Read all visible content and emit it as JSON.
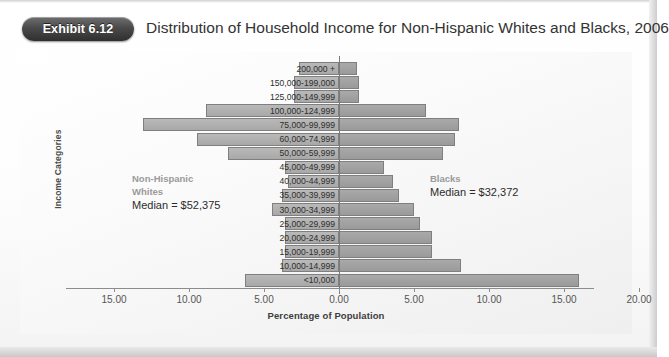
{
  "exhibit": {
    "badge_label": "Exhibit 6.12"
  },
  "header": {
    "title": "Distribution of Household Income for Non-Hispanic Whites and Blacks, 2006"
  },
  "annotations": {
    "left": {
      "group_line1": "Non-Hispanic",
      "group_line2": "Whites",
      "median": "Median = $52,375"
    },
    "right": {
      "group_line1": "Blacks",
      "median": "Median = $32,372"
    }
  },
  "chart_data": {
    "type": "bar",
    "subtype": "population-pyramid",
    "title": "Distribution of Household Income for Non-Hispanic Whites and Blacks, 2006",
    "xlabel": "Percentage of Population",
    "ylabel": "Income Categories",
    "grid": false,
    "legend_position": "in-plot-annotations",
    "x_tick_labels": [
      "15.00",
      "10.00",
      "5.00",
      "0.00",
      "5.00",
      "10.00",
      "15.00",
      "20.00"
    ],
    "x_tick_values": [
      -15,
      -10,
      -5,
      0,
      5,
      10,
      15,
      20
    ],
    "xlim": [
      -17.5,
      21.5
    ],
    "categories": [
      "200,000 +",
      "150,000-199,000",
      "125,000-149,999",
      "100,000-124,999",
      "75,000-99,999",
      "60,000-74,999",
      "50,000-59,999",
      "45,000-49,999",
      "40,000-44,999",
      "35,000-39,999",
      "30,000-34,999",
      "25,000-29,999",
      "20,000-24,999",
      "15,000-19,999",
      "10,000-14,999",
      "<10,000"
    ],
    "series": [
      {
        "name": "Non-Hispanic Whites",
        "side": "left",
        "color": "#b0b0b0",
        "values": [
          2.7,
          3.0,
          3.0,
          8.9,
          13.1,
          9.5,
          7.4,
          3.6,
          3.4,
          3.8,
          4.5,
          3.6,
          3.6,
          3.6,
          3.8,
          6.3
        ]
      },
      {
        "name": "Blacks",
        "side": "right",
        "color": "#a0a0a0",
        "values": [
          1.2,
          1.3,
          1.3,
          5.8,
          8.0,
          7.7,
          6.9,
          3.0,
          3.6,
          4.0,
          5.0,
          5.4,
          6.2,
          6.2,
          8.1,
          16.0
        ]
      }
    ]
  }
}
